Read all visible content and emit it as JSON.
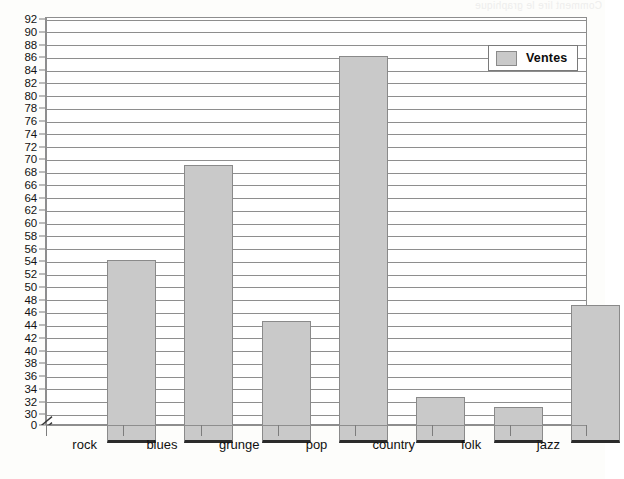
{
  "chart_data": {
    "type": "bar",
    "title": "",
    "subtitle": "",
    "xlabel": "",
    "ylabel": "",
    "categories": [
      "rock",
      "blues",
      "grunge",
      "pop",
      "country",
      "folk",
      "jazz"
    ],
    "series": [
      {
        "name": "Ventes",
        "values": [
          57,
          72,
          47.5,
          89,
          35.5,
          34,
          50
        ],
        "color": "#c9c9c9",
        "border_color": "#8a8a8a"
      }
    ],
    "ylim": [
      30,
      92
    ],
    "y_baseline": 0,
    "y_tick_step": 2,
    "y_tick_labels": [
      "92",
      "90",
      "88",
      "86",
      "84",
      "82",
      "80",
      "78",
      "76",
      "74",
      "72",
      "70",
      "68",
      "66",
      "64",
      "62",
      "60",
      "58",
      "56",
      "54",
      "52",
      "50",
      "48",
      "46",
      "44",
      "42",
      "40",
      "38",
      "36",
      "34",
      "32",
      "30",
      "0"
    ],
    "y_axis_break": true,
    "y_axis_break_between": [
      0,
      30
    ],
    "grid": true,
    "grid_axis": "y",
    "legend": {
      "position": "top-right",
      "entries": [
        {
          "label": "Ventes",
          "swatch_color": "#c9c9c9"
        }
      ]
    },
    "frame_color": "#8e8e8e",
    "background": "#ffffff"
  },
  "legend": {
    "label": "Ventes"
  },
  "artifacts": {
    "bleed_text": "Comment lire le graphique"
  }
}
